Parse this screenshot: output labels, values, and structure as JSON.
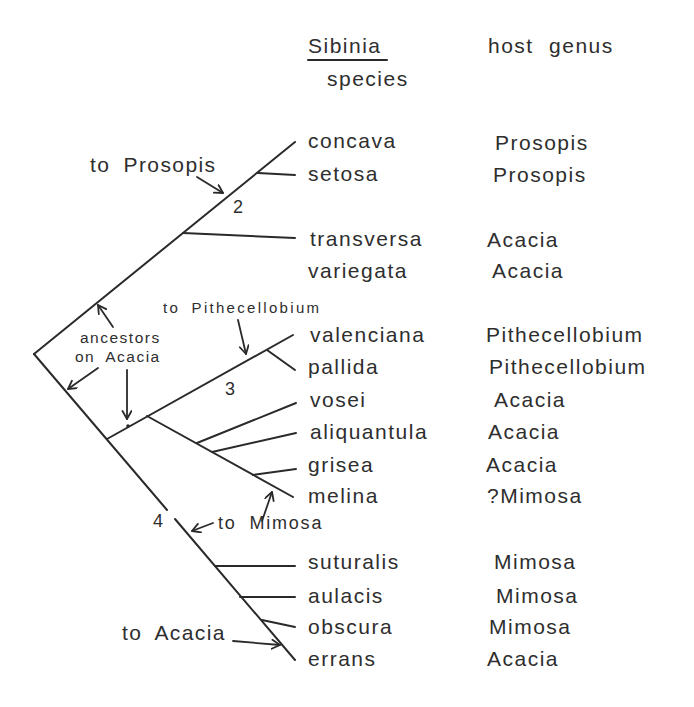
{
  "header": {
    "species_title": "Sibinia",
    "species_subtitle": "species",
    "host_title": "host genus"
  },
  "taxa": [
    {
      "species": "concava",
      "host": "Prosopis"
    },
    {
      "species": "setosa",
      "host": "Prosopis"
    },
    {
      "species": "transversa",
      "host": "Acacia"
    },
    {
      "species": "variegata",
      "host": "Acacia"
    },
    {
      "species": "valenciana",
      "host": "Pithecellobium"
    },
    {
      "species": "pallida",
      "host": "Pithecellobium"
    },
    {
      "species": "vosei",
      "host": "Acacia"
    },
    {
      "species": "aliquantula",
      "host": "Acacia"
    },
    {
      "species": "grisea",
      "host": "Acacia"
    },
    {
      "species": "melina",
      "host": "?Mimosa"
    },
    {
      "species": "suturalis",
      "host": "Mimosa"
    },
    {
      "species": "aulacis",
      "host": "Mimosa"
    },
    {
      "species": "obscura",
      "host": "Mimosa"
    },
    {
      "species": "errans",
      "host": "Acacia"
    }
  ],
  "annotations": {
    "to_prosopis": "to Prosopis",
    "to_pithecellobium": "to Pithecellobium",
    "ancestors_line1": "ancestors",
    "ancestors_line2": "on Acacia",
    "to_mimosa": "to Mimosa",
    "to_acacia": "to Acacia"
  },
  "nodes": {
    "node_2": "2",
    "node_3": "3",
    "node_4": "4"
  },
  "colors": {
    "ink": "#2a2a2a",
    "text": "#2e2e2e",
    "background": "#ffffff"
  }
}
